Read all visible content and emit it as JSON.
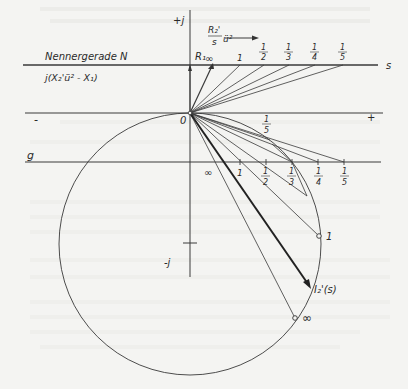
{
  "figure": {
    "type": "circle-diagram",
    "labels": {
      "plus_j": "+j",
      "minus_j": "-j",
      "origin": "0",
      "minus": "-",
      "plus": "+",
      "g_line": "g",
      "s_axis": "s",
      "denominator_line": "Nennergerade N",
      "denominator_expr": "j(X₂'ü² - X₁)",
      "r1": "R₁",
      "r2_num": "R₂'",
      "r2_den": "s",
      "r2_factor": "ü²",
      "current_label": "I₂'(s)",
      "circle_point_1": "1",
      "circle_point_inf": "∞"
    },
    "n_line_points": [
      {
        "label": "∞"
      },
      {
        "label": "1"
      },
      {
        "num": "1",
        "den": "2"
      },
      {
        "num": "1",
        "den": "3"
      },
      {
        "num": "1",
        "den": "4"
      },
      {
        "num": "1",
        "den": "5"
      }
    ],
    "g_line_points": [
      {
        "label": "∞"
      },
      {
        "label": "1"
      },
      {
        "num": "1",
        "den": "2"
      },
      {
        "num": "1",
        "den": "3"
      },
      {
        "num": "1",
        "den": "4"
      },
      {
        "num": "1",
        "den": "5"
      }
    ],
    "inner_label": {
      "num": "1",
      "den": "5"
    }
  }
}
